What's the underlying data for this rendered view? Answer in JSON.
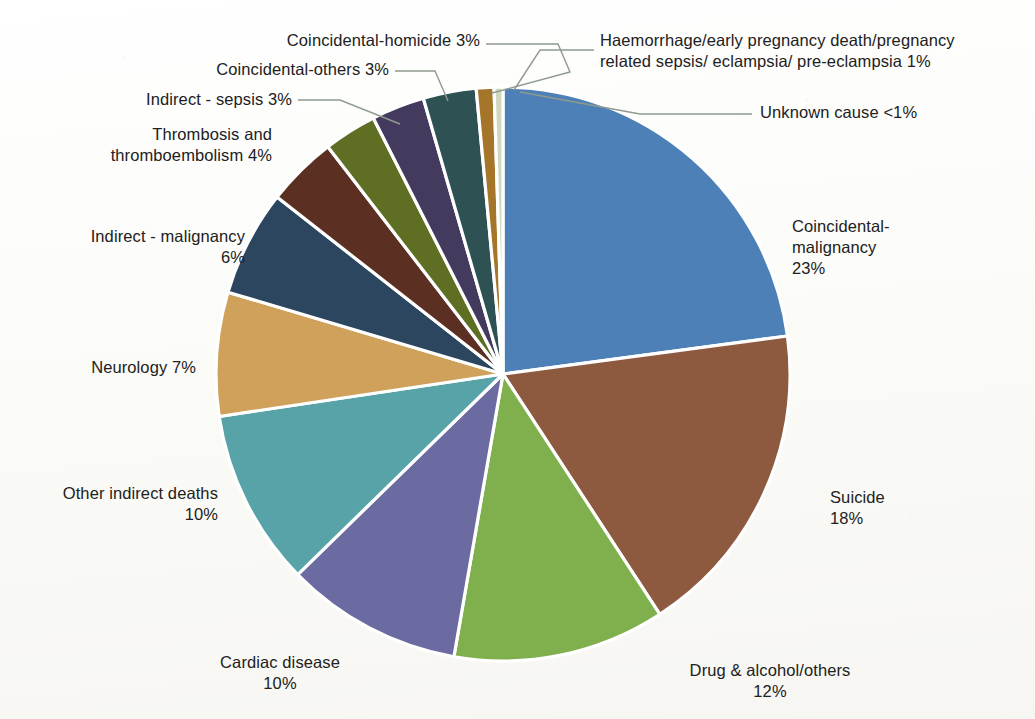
{
  "chart_data": {
    "type": "pie",
    "title": "",
    "subtitle": "",
    "xlabel": "",
    "ylabel": "",
    "legend_position": "none",
    "grid": false,
    "start_angle_deg": 0,
    "direction": "clockwise",
    "categories": [
      "Coincidental-malignancy",
      "Suicide",
      "Drug & alcohol/others",
      "Cardiac disease",
      "Other indirect deaths",
      "Neurology",
      "Indirect - malignancy",
      "Thrombosis and thromboembolism",
      "Indirect - sepsis",
      "Coincidental-others",
      "Coincidental-homicide",
      "Haemorrhage/early pregnancy death/pregnancy related sepsis/ eclampsia/ pre-eclampsia",
      "Unknown cause"
    ],
    "values": [
      23,
      18,
      12,
      10,
      10,
      7,
      6,
      4,
      3,
      3,
      3,
      1,
      0.5
    ],
    "value_labels": [
      "23%",
      "18%",
      "12%",
      "10%",
      "10%",
      "7%",
      "6%",
      "4%",
      "3%",
      "3%",
      "3%",
      "1%",
      "<1%"
    ],
    "colors": [
      "#4E80B8",
      "#8E5A3F",
      "#80AF4D",
      "#6B6AA1",
      "#57A3A8",
      "#CFA15B",
      "#2C4660",
      "#5B2F22",
      "#5E6E23",
      "#433A5E",
      "#2E5254",
      "#A5762A",
      "#CFD9BE"
    ],
    "slice_separator_color": "#ffffff"
  },
  "labels": [
    {
      "id": "coincidental-malignancy",
      "text": "Coincidental-\nmalignancy\n23%",
      "align": "left"
    },
    {
      "id": "suicide",
      "text": "Suicide\n18%",
      "align": "left"
    },
    {
      "id": "drug-alcohol-others",
      "text": "Drug & alcohol/others\n12%",
      "align": "center"
    },
    {
      "id": "cardiac-disease",
      "text": "Cardiac disease\n10%",
      "align": "center"
    },
    {
      "id": "other-indirect-deaths",
      "text": "Other indirect deaths\n10%",
      "align": "right"
    },
    {
      "id": "neurology",
      "text": "Neurology  7%",
      "align": "right"
    },
    {
      "id": "indirect-malignancy",
      "text": "Indirect - malignancy\n6%",
      "align": "right"
    },
    {
      "id": "thrombosis-thromboembolism",
      "text": "Thrombosis and\nthromboembolism 4%",
      "align": "right"
    },
    {
      "id": "indirect-sepsis",
      "text": "Indirect - sepsis 3%",
      "align": "right"
    },
    {
      "id": "coincidental-others",
      "text": "Coincidental-others 3%",
      "align": "right"
    },
    {
      "id": "coincidental-homicide",
      "text": "Coincidental-homicide 3%",
      "align": "right"
    },
    {
      "id": "haemorrhage",
      "text": "Haemorrhage/early pregnancy death/pregnancy\nrelated sepsis/ eclampsia/ pre-eclampsia 1%",
      "align": "left"
    },
    {
      "id": "unknown-cause",
      "text": "Unknown cause <1%",
      "align": "left"
    }
  ]
}
